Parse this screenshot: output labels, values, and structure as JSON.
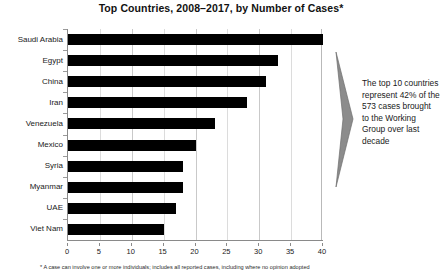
{
  "chart_data": {
    "type": "bar",
    "orientation": "horizontal",
    "title": "Top Countries, 2008–2017, by Number of Cases*",
    "xlabel": "",
    "ylabel": "",
    "xlim": [
      0,
      40
    ],
    "xticks": [
      0,
      5,
      10,
      15,
      20,
      25,
      30,
      35,
      40
    ],
    "xtick_labels": [
      "0",
      "5",
      "10",
      "15",
      "20",
      "25",
      "30",
      "35",
      "40"
    ],
    "grid": true,
    "legend": false,
    "bar_color": "#000000",
    "categories": [
      "Saudi Arabia",
      "Egypt",
      "China",
      "Iran",
      "Venezuela",
      "Mexico",
      "Syria",
      "Myanmar",
      "UAE",
      "Viet Nam"
    ],
    "values": [
      40,
      33,
      31,
      28,
      23,
      20,
      18,
      18,
      17,
      15
    ],
    "annotations": [
      "The top 10 countries represent 42% of the 573 cases brought to the Working Group over last decade"
    ]
  },
  "annotation": {
    "text": "The top 10 countries represent 42% of the 573 cases brought to the Working Group over last decade",
    "arrow_color": "#8c8c8c"
  },
  "footnote": {
    "text": "* A case can involve one or more individuals; includes all reported cases, including where no opinion adopted"
  }
}
